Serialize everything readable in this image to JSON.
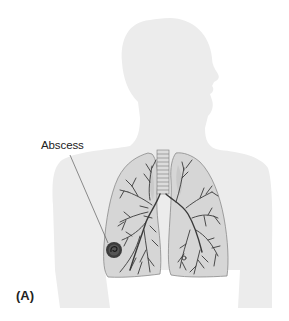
{
  "figure": {
    "panel_label": "(A)",
    "annotations": [
      {
        "label": "Abscess",
        "target": "abscess-lesion-right-lower-lung"
      }
    ],
    "elements": {
      "silhouette": "human-head-and-torso-profile",
      "organs": [
        "trachea",
        "right-lung",
        "left-lung",
        "bronchial-tree"
      ],
      "lesion": "abscess"
    }
  },
  "colors": {
    "background": "#ffffff",
    "silhouette": "#ececec",
    "lung_fill": "#d6d6d6",
    "lung_outline": "#8a8a8a",
    "bronchi": "#3a3a3a",
    "abscess": "#3c3c3c",
    "text": "#222222"
  }
}
